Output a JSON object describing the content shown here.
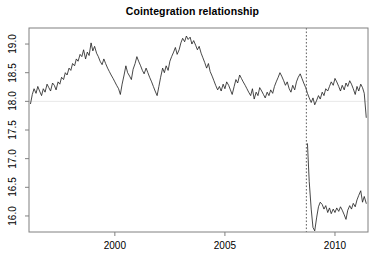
{
  "chart_data": {
    "type": "line",
    "title": "Cointegration relationship",
    "xlabel": "",
    "ylabel": "",
    "xlim": [
      1996.1,
      2011.5
    ],
    "ylim": [
      15.72,
      19.28
    ],
    "xticks": [
      2000,
      2005,
      2010
    ],
    "xtick_labels": [
      "2000",
      "2005",
      "2010"
    ],
    "yticks": [
      16.0,
      16.5,
      17.0,
      17.5,
      18.0,
      18.5,
      19.0
    ],
    "ytick_labels": [
      "16.0",
      "16.5",
      "17.0",
      "17.5",
      "18.0",
      "18.5",
      "19.0"
    ],
    "grid": false,
    "box": true,
    "line_color": "#000000",
    "annotations": [
      {
        "type": "hline",
        "name": "reference-level",
        "y": 18.0,
        "color": "#e8e8e8",
        "style": "solid"
      },
      {
        "type": "vline",
        "name": "structural-break",
        "x": 2008.7,
        "color": "#555555",
        "style": "dotted"
      }
    ],
    "legend": null,
    "x": [
      1996.17,
      1996.25,
      1996.33,
      1996.42,
      1996.5,
      1996.58,
      1996.67,
      1996.75,
      1996.83,
      1996.92,
      1997.0,
      1997.08,
      1997.17,
      1997.25,
      1997.33,
      1997.42,
      1997.5,
      1997.58,
      1997.67,
      1997.75,
      1997.83,
      1997.92,
      1998.0,
      1998.08,
      1998.17,
      1998.25,
      1998.33,
      1998.42,
      1998.5,
      1998.58,
      1998.67,
      1998.75,
      1998.83,
      1998.92,
      1999.0,
      1999.08,
      1999.17,
      1999.25,
      1999.33,
      1999.42,
      1999.5,
      1999.58,
      1999.67,
      1999.75,
      1999.83,
      1999.92,
      2000.0,
      2000.08,
      2000.17,
      2000.25,
      2000.33,
      2000.42,
      2000.5,
      2000.58,
      2000.67,
      2000.75,
      2000.83,
      2000.92,
      2001.0,
      2001.08,
      2001.17,
      2001.25,
      2001.33,
      2001.42,
      2001.5,
      2001.58,
      2001.67,
      2001.75,
      2001.83,
      2001.92,
      2002.0,
      2002.08,
      2002.17,
      2002.25,
      2002.33,
      2002.42,
      2002.5,
      2002.58,
      2002.67,
      2002.75,
      2002.83,
      2002.92,
      2003.0,
      2003.08,
      2003.17,
      2003.25,
      2003.33,
      2003.42,
      2003.5,
      2003.58,
      2003.67,
      2003.75,
      2003.83,
      2003.92,
      2004.0,
      2004.08,
      2004.17,
      2004.25,
      2004.33,
      2004.42,
      2004.5,
      2004.58,
      2004.67,
      2004.75,
      2004.83,
      2004.92,
      2005.0,
      2005.08,
      2005.17,
      2005.25,
      2005.33,
      2005.42,
      2005.5,
      2005.58,
      2005.67,
      2005.75,
      2005.83,
      2005.92,
      2006.0,
      2006.08,
      2006.17,
      2006.25,
      2006.33,
      2006.42,
      2006.5,
      2006.58,
      2006.67,
      2006.75,
      2006.83,
      2006.92,
      2007.0,
      2007.08,
      2007.17,
      2007.25,
      2007.33,
      2007.42,
      2007.5,
      2007.58,
      2007.67,
      2007.75,
      2007.83,
      2007.92,
      2008.0,
      2008.08,
      2008.17,
      2008.25,
      2008.33,
      2008.42,
      2008.5,
      2008.58,
      2008.67,
      2008.75,
      2008.83,
      2008.92,
      2009.0,
      2009.08,
      2009.17,
      2009.25,
      2009.33,
      2009.42,
      2009.5,
      2009.58,
      2009.67,
      2009.75,
      2009.83,
      2009.92,
      2010.0,
      2010.08,
      2010.17,
      2010.25,
      2010.33,
      2010.42,
      2010.5,
      2010.58,
      2010.67,
      2010.75,
      2010.83,
      2010.92,
      2011.0,
      2011.08,
      2011.17,
      2011.25,
      2011.33,
      2011.42
    ],
    "values": [
      17.96,
      18.12,
      18.22,
      18.14,
      18.26,
      18.18,
      18.1,
      18.22,
      18.16,
      18.3,
      18.24,
      18.18,
      18.32,
      18.28,
      18.2,
      18.34,
      18.3,
      18.42,
      18.38,
      18.5,
      18.46,
      18.58,
      18.54,
      18.66,
      18.62,
      18.74,
      18.7,
      18.82,
      18.78,
      18.9,
      18.74,
      18.86,
      18.8,
      19.02,
      18.88,
      18.96,
      18.84,
      18.78,
      18.7,
      18.64,
      18.74,
      18.66,
      18.58,
      18.52,
      18.46,
      18.4,
      18.34,
      18.28,
      18.22,
      18.12,
      18.3,
      18.46,
      18.62,
      18.5,
      18.44,
      18.38,
      18.56,
      18.66,
      18.78,
      18.7,
      18.62,
      18.54,
      18.48,
      18.58,
      18.5,
      18.42,
      18.34,
      18.26,
      18.18,
      18.1,
      18.26,
      18.42,
      18.58,
      18.5,
      18.62,
      18.54,
      18.7,
      18.78,
      18.86,
      18.94,
      18.82,
      18.9,
      19.02,
      19.1,
      19.04,
      19.14,
      19.08,
      19.12,
      19.0,
      19.06,
      18.98,
      18.9,
      18.96,
      18.84,
      18.76,
      18.68,
      18.58,
      18.66,
      18.52,
      18.44,
      18.36,
      18.28,
      18.2,
      18.26,
      18.18,
      18.3,
      18.22,
      18.34,
      18.28,
      18.2,
      18.12,
      18.26,
      18.38,
      18.32,
      18.46,
      18.4,
      18.34,
      18.28,
      18.22,
      18.16,
      18.1,
      18.22,
      18.04,
      18.16,
      18.1,
      18.24,
      18.18,
      18.12,
      18.06,
      18.16,
      18.1,
      18.2,
      18.14,
      18.26,
      18.34,
      18.42,
      18.5,
      18.44,
      18.36,
      18.28,
      18.34,
      18.22,
      18.16,
      18.28,
      18.2,
      18.34,
      18.42,
      18.48,
      18.4,
      18.32,
      18.24,
      18.14,
      18.06,
      17.98,
      18.06,
      17.94,
      18.02,
      18.1,
      18.04,
      18.16,
      18.1,
      18.22,
      18.18,
      18.26,
      18.34,
      18.28,
      18.4,
      18.34,
      18.26,
      18.18,
      18.28,
      18.2,
      18.32,
      18.26,
      18.36,
      18.3,
      18.22,
      18.12,
      18.26,
      18.18,
      18.3,
      18.24,
      18.14,
      17.72
    ],
    "post_break_x": [
      2008.75,
      2008.83,
      2008.92,
      2009.0,
      2009.08,
      2009.17,
      2009.25,
      2009.33,
      2009.42,
      2009.5,
      2009.58,
      2009.67,
      2009.75,
      2009.83,
      2009.92,
      2010.0,
      2010.08,
      2010.17,
      2010.25,
      2010.33,
      2010.42,
      2010.5,
      2010.58,
      2010.67,
      2010.75,
      2010.83,
      2010.92,
      2011.0,
      2011.08,
      2011.17,
      2011.25,
      2011.33,
      2011.42
    ],
    "post_break_values": [
      17.26,
      16.6,
      16.12,
      15.8,
      15.74,
      15.98,
      16.16,
      16.24,
      16.2,
      16.12,
      16.18,
      16.06,
      16.14,
      16.04,
      16.12,
      16.06,
      16.14,
      16.08,
      16.16,
      16.1,
      16.02,
      15.94,
      16.1,
      16.18,
      16.12,
      16.22,
      16.16,
      16.28,
      16.36,
      16.44,
      16.24,
      16.34,
      16.22
    ],
    "break_year": 2008.7,
    "n_points": 184,
    "y_range_observed": [
      15.74,
      19.14
    ]
  }
}
